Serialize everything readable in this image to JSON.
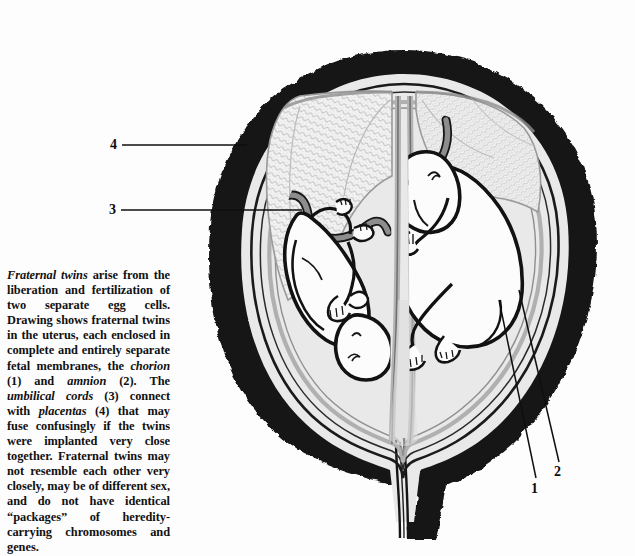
{
  "figure": {
    "title": "Fraternal twins in the uterus",
    "type": "anatomical-illustration",
    "view": "mid-sagittal cutaway section",
    "palette": {
      "ink": "#111111",
      "uterine_wall": "#141414",
      "uterine_fill": "#e8e8e8",
      "membrane_gray": "#b4b4b4",
      "cord_gray": "#8d8d8d",
      "placenta_texture": "#d2d2d2",
      "fetus_fill": "#fbfbfb",
      "page_background": "#fdfdfd"
    },
    "parts": [
      {
        "number": "1",
        "name": "chorion",
        "description": "outer fetal membrane"
      },
      {
        "number": "2",
        "name": "amnion",
        "description": "inner fetal membrane"
      },
      {
        "number": "3",
        "name": "umbilical cords",
        "description": "connect each fetus with its placenta"
      },
      {
        "number": "4",
        "name": "placentas",
        "description": "may fuse confusingly if the twins were implanted very close together"
      }
    ],
    "fetuses": [
      {
        "id": "left-fetus",
        "position": "inverted, head toward lower right"
      },
      {
        "id": "right-fetus",
        "position": "curled fetal position, head toward upper left"
      }
    ]
  },
  "labels": {
    "one": "1",
    "two": "2",
    "three": "3",
    "four": "4"
  },
  "caption": {
    "lead": "Fraternal twins",
    "body_1": " arise from the liberation and fertilization of two separate egg cells. Drawing shows fraternal twins in the uterus, each enclosed in complete and entirely separate fetal membranes, the ",
    "term_chorion": "chorion",
    "body_2": " (1) and ",
    "term_amnion": "amnion",
    "body_3": " (2). The ",
    "term_cords": "umbilical cords",
    "body_4": " (3) connect with ",
    "term_placentas": "placentas",
    "body_5": " (4) that may fuse confusingly if the twins were implanted very close together. Fraternal twins may not resemble each other very closely, may be of different sex, and do not have identical “packages” of heredity-carrying chromosomes and genes.",
    "full_text": "Fraternal twins arise from the liberation and fertilization of two separate egg cells. Drawing shows fraternal twins in the uterus, each enclosed in complete and entirely separate fetal membranes, the chorion (1) and amnion (2). The umbilical cords (3) connect with placentas (4) that may fuse confusingly if the twins were implanted very close together. Fraternal twins may not resemble each other very closely, may be of different sex, and do not have identical “packages” of heredity-carrying chromosomes and genes."
  }
}
